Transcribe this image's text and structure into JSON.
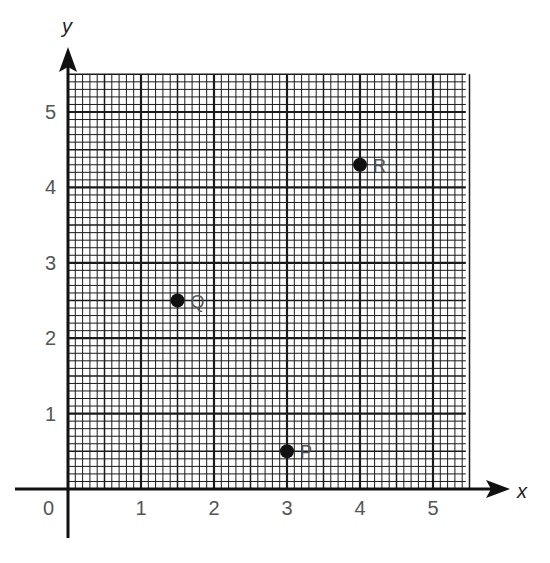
{
  "chart_data": {
    "type": "scatter",
    "title": "",
    "xlabel": "x",
    "ylabel": "y",
    "xlim": [
      0,
      5.45
    ],
    "ylim": [
      0,
      5.5
    ],
    "grid": true,
    "grid_minor_divisions_per_unit": 10,
    "origin_label": "0",
    "x_ticks": [
      1,
      2,
      3,
      4,
      5
    ],
    "x_tick_labels": [
      "1",
      "2",
      "3",
      "4",
      "5"
    ],
    "y_ticks": [
      1,
      2,
      3,
      4,
      5
    ],
    "y_tick_labels": [
      "1",
      "2",
      "3",
      "4",
      "5"
    ],
    "points": [
      {
        "label": "P",
        "x": 3,
        "y": 0.5
      },
      {
        "label": "Q",
        "x": 1.5,
        "y": 2.5
      },
      {
        "label": "R",
        "x": 4,
        "y": 4.3
      }
    ],
    "legend": null
  },
  "colors": {
    "ink": "#111111",
    "tick_text": "#555555",
    "background": "#ffffff"
  }
}
